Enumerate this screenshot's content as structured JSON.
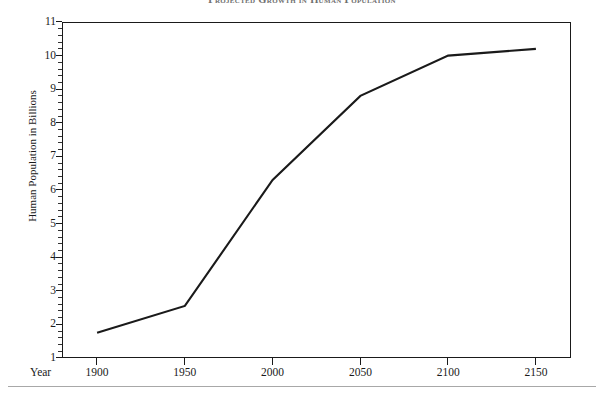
{
  "chart_data": {
    "type": "line",
    "title": "Projected Growth in Human Population",
    "xlabel": "Year",
    "ylabel": "Human Population in Billions",
    "x": [
      1900,
      1950,
      2000,
      2050,
      2100,
      2150
    ],
    "values": [
      1.75,
      2.55,
      6.3,
      8.8,
      10.0,
      10.2
    ],
    "series": [
      {
        "name": "Human Population",
        "values": [
          1.75,
          2.55,
          6.3,
          8.8,
          10.0,
          10.2
        ]
      }
    ],
    "xlim": [
      1880,
      2170
    ],
    "ylim": [
      1,
      11
    ],
    "x_tick_labels": [
      "1900",
      "1950",
      "2000",
      "2050",
      "2100",
      "2150"
    ],
    "y_tick_labels": [
      "1",
      "2",
      "3",
      "4",
      "5",
      "6",
      "7",
      "8",
      "9",
      "10",
      "11"
    ],
    "y_ticks": [
      1,
      2,
      3,
      4,
      5,
      6,
      7,
      8,
      9,
      10,
      11
    ],
    "y_minor_ticks_per_interval": 4,
    "grid": false,
    "legend": "none",
    "line_color": "#1a1a1a",
    "line_width": 2.1,
    "frame_color": "#1a1a1a",
    "background": "#ffffff"
  },
  "axes": {
    "y_label": "Human Population in Billions",
    "x_label": "Year"
  }
}
